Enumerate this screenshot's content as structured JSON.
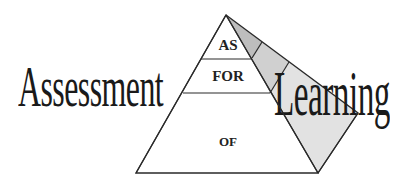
{
  "diagram": {
    "title_left": "Assessment",
    "title_right": "Learning",
    "pyramid": {
      "levels": [
        {
          "label": "AS",
          "position": "top"
        },
        {
          "label": "FOR",
          "position": "middle"
        },
        {
          "label": "OF",
          "position": "bottom"
        }
      ]
    },
    "colors": {
      "line": "#2a2a2a",
      "side_top": "#bdbdbd",
      "side_middle": "#d0d0d0",
      "side_bottom": "#e2e2e2",
      "front": "#ffffff",
      "text": "#1a1a1a"
    }
  }
}
